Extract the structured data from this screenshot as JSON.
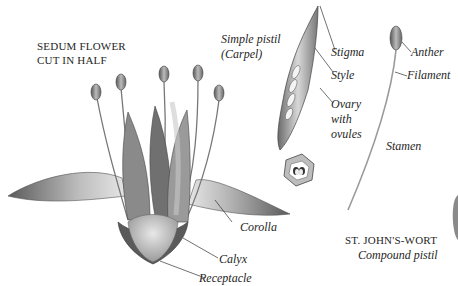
{
  "diagram": {
    "type": "botanical-illustration",
    "palette": {
      "ink": "#262626",
      "shade_dark": "#4a4a4a",
      "shade_mid": "#8a8a8a",
      "shade_light": "#cfcfcf",
      "background": "#ffffff"
    }
  },
  "sedum": {
    "title_line1": "SEDUM FLOWER",
    "title_line2": "CUT IN HALF",
    "labels": {
      "corolla": "Corolla",
      "calyx": "Calyx",
      "receptacle": "Receptacle"
    }
  },
  "pistil": {
    "title_line1": "Simple pistil",
    "title_line2": "(Carpel)",
    "labels": {
      "stigma": "Stigma",
      "style": "Style",
      "ovary_line1": "Ovary",
      "ovary_line2": "with",
      "ovary_line3": "ovules"
    }
  },
  "stamen": {
    "labels": {
      "anther": "Anther",
      "filament": "Filament",
      "stamen": "Stamen"
    }
  },
  "st_johns_wort": {
    "title": "ST. JOHN'S-WORT",
    "subtitle": "Compound pistil"
  }
}
